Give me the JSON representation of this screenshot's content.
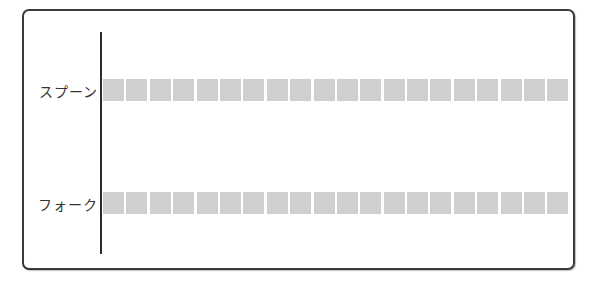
{
  "chart_data": {
    "type": "bar",
    "orientation": "horizontal",
    "style": "pictograph-units",
    "categories": [
      "スプーン",
      "フォーク"
    ],
    "values": [
      20,
      20
    ],
    "unit_color": "#cfcfcf",
    "title": "",
    "xlabel": "",
    "ylabel": "",
    "grid": false,
    "legend": null
  },
  "rows": [
    {
      "label": "スプーン",
      "count": 20
    },
    {
      "label": "フォーク",
      "count": 20
    }
  ]
}
